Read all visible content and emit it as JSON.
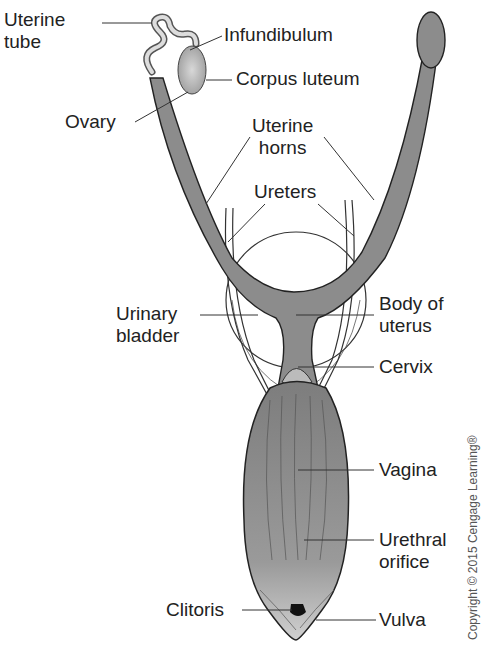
{
  "diagram": {
    "labels": {
      "uterine_tube": [
        "Uterine",
        "tube"
      ],
      "infundibulum": "Infundibulum",
      "corpus_luteum": "Corpus luteum",
      "ovary": "Ovary",
      "uterine_horns": [
        "Uterine",
        "horns"
      ],
      "ureters": "Ureters",
      "urinary_bladder": [
        "Urinary",
        "bladder"
      ],
      "body_of_uterus": [
        "Body of",
        "uterus"
      ],
      "cervix": "Cervix",
      "vagina": "Vagina",
      "urethral_orifice": [
        "Urethral",
        "orifice"
      ],
      "clitoris": "Clitoris",
      "vulva": "Vulva"
    },
    "copyright": "Copyright © 2015 Cengage Learning®",
    "colors": {
      "tissue": "#8c8c8c",
      "outline": "#222222",
      "leader": "#333333"
    }
  }
}
